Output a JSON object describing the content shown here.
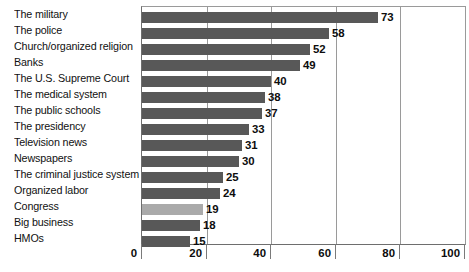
{
  "chart_data": {
    "type": "bar",
    "orientation": "horizontal",
    "title": "",
    "subtitle": "",
    "xlabel": "",
    "ylabel": "",
    "xlim": [
      0,
      100
    ],
    "xticks": [
      0,
      20,
      40,
      60,
      80,
      100
    ],
    "grid": true,
    "legend": null,
    "categories": [
      "The military",
      "The police",
      "Church/organized religion",
      "Banks",
      "The U.S. Supreme Court",
      "The medical system",
      "The public schools",
      "The presidency",
      "Television news",
      "Newspapers",
      "The criminal justice system",
      "Organized labor",
      "Congress",
      "Big business",
      "HMOs"
    ],
    "values": [
      73,
      58,
      52,
      49,
      40,
      38,
      37,
      33,
      31,
      30,
      25,
      24,
      19,
      18,
      15
    ],
    "highlighted_categories": [
      "Congress"
    ],
    "colors": {
      "bar": "#585858",
      "bar_highlight": "#aaaaaa",
      "axis": "#6e6e6e",
      "grid": "#9a9a9a",
      "text": "#111111",
      "background": "#ffffff"
    }
  }
}
